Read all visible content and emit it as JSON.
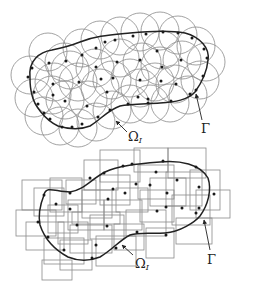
{
  "figure": {
    "colors": {
      "boundary": "#222222",
      "support": "#8a8a8a",
      "node": "#1a1a1a",
      "background": "#ffffff"
    }
  },
  "panels": [
    {
      "id": "circular-supports",
      "support_shape": "circle",
      "boundary_label": "Γ",
      "support_label": "Ω",
      "support_label_sub": "I",
      "boundary_path": "M30,78 C28,60 40,52 52,50 C62,48 70,46 80,42 C95,36 110,35 130,33 C150,31 170,30 185,33 C200,37 210,48 208,60 C207,72 200,85 195,92 C188,100 175,102 160,103 C145,104 130,104 120,106 C108,110 100,120 90,126 C80,130 68,129 58,126 C45,120 34,105 32,95 C30,88 30,83 30,78 Z",
      "circle_r": 19,
      "circles": [
        [
          30,
          75
        ],
        [
          48,
          52
        ],
        [
          64,
          62
        ],
        [
          82,
          48
        ],
        [
          100,
          40
        ],
        [
          120,
          36
        ],
        [
          140,
          32
        ],
        [
          160,
          31
        ],
        [
          178,
          35
        ],
        [
          196,
          46
        ],
        [
          206,
          62
        ],
        [
          200,
          80
        ],
        [
          188,
          95
        ],
        [
          170,
          103
        ],
        [
          150,
          104
        ],
        [
          130,
          104
        ],
        [
          112,
          110
        ],
        [
          96,
          122
        ],
        [
          78,
          128
        ],
        [
          60,
          126
        ],
        [
          44,
          116
        ],
        [
          34,
          98
        ],
        [
          54,
          82
        ],
        [
          52,
          95
        ],
        [
          78,
          82
        ],
        [
          65,
          100
        ],
        [
          88,
          100
        ],
        [
          95,
          68
        ],
        [
          112,
          80
        ],
        [
          120,
          58
        ],
        [
          142,
          62
        ],
        [
          162,
          50
        ],
        [
          182,
          60
        ],
        [
          155,
          82
        ],
        [
          175,
          84
        ],
        [
          140,
          88
        ],
        [
          100,
          88
        ],
        [
          70,
          70
        ],
        [
          130,
          78
        ],
        [
          160,
          66
        ]
      ],
      "boundary_nodes": [
        [
          28,
          77
        ],
        [
          32,
          68
        ],
        [
          49,
          63
        ],
        [
          66,
          61
        ],
        [
          82,
          55
        ],
        [
          96,
          48
        ],
        [
          105,
          42
        ],
        [
          115,
          40
        ],
        [
          133,
          36
        ],
        [
          146,
          34
        ],
        [
          163,
          32
        ],
        [
          178,
          33
        ],
        [
          192,
          38
        ],
        [
          204,
          49
        ],
        [
          207,
          58
        ],
        [
          203,
          76
        ],
        [
          196,
          90
        ],
        [
          190,
          94
        ],
        [
          171,
          101
        ],
        [
          148,
          103
        ],
        [
          128,
          104
        ],
        [
          110,
          110
        ],
        [
          98,
          117
        ],
        [
          82,
          124
        ],
        [
          72,
          127
        ],
        [
          62,
          127
        ],
        [
          50,
          119
        ],
        [
          44,
          113
        ],
        [
          38,
          104
        ],
        [
          34,
          92
        ]
      ],
      "interior_nodes": [
        [
          53,
          84
        ],
        [
          79,
          82
        ],
        [
          53,
          95
        ],
        [
          65,
          101
        ],
        [
          87,
          106
        ],
        [
          96,
          67
        ],
        [
          117,
          62
        ],
        [
          101,
          79
        ],
        [
          113,
          78
        ],
        [
          140,
          80
        ],
        [
          157,
          51
        ],
        [
          162,
          67
        ],
        [
          181,
          60
        ],
        [
          161,
          81
        ],
        [
          176,
          84
        ],
        [
          107,
          92
        ],
        [
          138,
          97
        ],
        [
          148,
          99
        ],
        [
          140,
          60
        ]
      ],
      "gamma_arrow": {
        "x1": 202,
        "y1": 120,
        "x2": 196,
        "y2": 94,
        "label_x": 201,
        "label_y": 133
      },
      "omega_arrow": {
        "x1": 127,
        "y1": 132,
        "x2": 116,
        "y2": 121,
        "label_x": 128,
        "label_y": 141
      }
    },
    {
      "id": "rectangular-supports",
      "support_shape": "rectangle",
      "boundary_label": "Γ",
      "support_label": "Ω",
      "support_label_sub": "I",
      "boundary_path": "M44,195 C46,185 56,192 70,192 C84,190 90,180 105,172 C118,166 135,164 160,162 C180,160 200,164 208,178 C212,190 208,205 200,216 C195,222 180,232 165,233 C150,234 140,232 130,235 C120,240 112,250 100,257 C90,261 80,262 68,257 C55,250 45,240 40,225 C38,215 40,205 44,195 Z",
      "rects": [
        [
          22,
          180,
          40,
          30
        ],
        [
          34,
          188,
          30,
          28
        ],
        [
          16,
          210,
          40,
          26
        ],
        [
          26,
          222,
          38,
          28
        ],
        [
          50,
          178,
          32,
          34
        ],
        [
          48,
          205,
          30,
          28
        ],
        [
          66,
          180,
          30,
          24
        ],
        [
          68,
          200,
          36,
          30
        ],
        [
          84,
          160,
          34,
          30
        ],
        [
          82,
          190,
          30,
          28
        ],
        [
          70,
          225,
          42,
          28
        ],
        [
          44,
          238,
          40,
          26
        ],
        [
          42,
          260,
          30,
          20
        ],
        [
          60,
          240,
          32,
          30
        ],
        [
          100,
          150,
          40,
          32
        ],
        [
          100,
          175,
          30,
          30
        ],
        [
          104,
          200,
          38,
          30
        ],
        [
          114,
          224,
          30,
          26
        ],
        [
          96,
          236,
          40,
          30
        ],
        [
          134,
          148,
          34,
          24
        ],
        [
          138,
          165,
          36,
          34
        ],
        [
          140,
          190,
          34,
          32
        ],
        [
          126,
          210,
          40,
          26
        ],
        [
          146,
          228,
          28,
          30
        ],
        [
          168,
          148,
          38,
          30
        ],
        [
          166,
          172,
          36,
          34
        ],
        [
          172,
          195,
          38,
          30
        ],
        [
          176,
          218,
          36,
          26
        ],
        [
          190,
          170,
          30,
          40
        ],
        [
          196,
          190,
          34,
          28
        ],
        [
          150,
          178,
          36,
          28
        ],
        [
          116,
          188,
          32,
          24
        ],
        [
          90,
          215,
          34,
          24
        ],
        [
          58,
          222,
          30,
          22
        ],
        [
          72,
          212,
          48,
          12
        ]
      ],
      "boundary_nodes": [
        [
          44,
          195
        ],
        [
          38,
          222
        ],
        [
          48,
          237
        ],
        [
          64,
          250
        ],
        [
          92,
          258
        ],
        [
          116,
          248
        ],
        [
          137,
          232
        ],
        [
          166,
          235
        ],
        [
          196,
          213
        ],
        [
          214,
          194
        ],
        [
          196,
          167
        ],
        [
          163,
          161
        ],
        [
          123,
          166
        ],
        [
          104,
          173
        ],
        [
          90,
          178
        ],
        [
          70,
          193
        ]
      ],
      "interior_nodes": [
        [
          56,
          204
        ],
        [
          70,
          209
        ],
        [
          77,
          225
        ],
        [
          107,
          226
        ],
        [
          96,
          245
        ],
        [
          108,
          199
        ],
        [
          125,
          193
        ],
        [
          136,
          184
        ],
        [
          150,
          185
        ],
        [
          167,
          193
        ],
        [
          157,
          211
        ],
        [
          166,
          207
        ],
        [
          182,
          208
        ],
        [
          199,
          208
        ],
        [
          199,
          187
        ],
        [
          156,
          172
        ],
        [
          177,
          180
        ],
        [
          132,
          164
        ],
        [
          113,
          189
        ]
      ],
      "gamma_arrow": {
        "x1": 210,
        "y1": 250,
        "x2": 204,
        "y2": 220,
        "label_x": 207,
        "label_y": 264
      },
      "omega_arrow": {
        "x1": 133,
        "y1": 255,
        "x2": 122,
        "y2": 245,
        "label_x": 135,
        "label_y": 268
      }
    }
  ]
}
